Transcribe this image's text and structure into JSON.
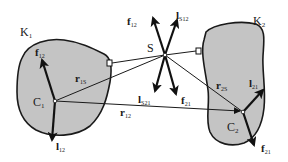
{
  "diagram": {
    "type": "mechanics-free-body-diagram",
    "colors": {
      "body_fill": "#c4c4c4",
      "stroke": "#1a1a1a",
      "background": "#ffffff"
    },
    "bodies": [
      {
        "id": "K1",
        "label": "K",
        "sub": "1",
        "centroid": {
          "label": "C",
          "sub": "1"
        }
      },
      {
        "id": "K2",
        "label": "K",
        "sub": "2",
        "centroid": {
          "label": "C",
          "sub": "2"
        }
      }
    ],
    "joint": {
      "label": "S"
    },
    "vectors": {
      "f12_body": {
        "label": "f",
        "sub": "12"
      },
      "l12_body": {
        "label": "l",
        "sub": "12"
      },
      "f12_joint": {
        "label": "f",
        "sub": "12"
      },
      "lS12": {
        "label": "l",
        "sub": "S12"
      },
      "lS21": {
        "label": "l",
        "sub": "S21"
      },
      "f21_joint": {
        "label": "f",
        "sub": "21"
      },
      "l21_body": {
        "label": "l",
        "sub": "21"
      },
      "f21_body": {
        "label": "f",
        "sub": "21"
      }
    },
    "position_vectors": {
      "r1S": {
        "label": "r",
        "sub": "1S"
      },
      "r2S": {
        "label": "r",
        "sub": "2S"
      },
      "r12": {
        "label": "r",
        "sub": "12"
      }
    }
  }
}
